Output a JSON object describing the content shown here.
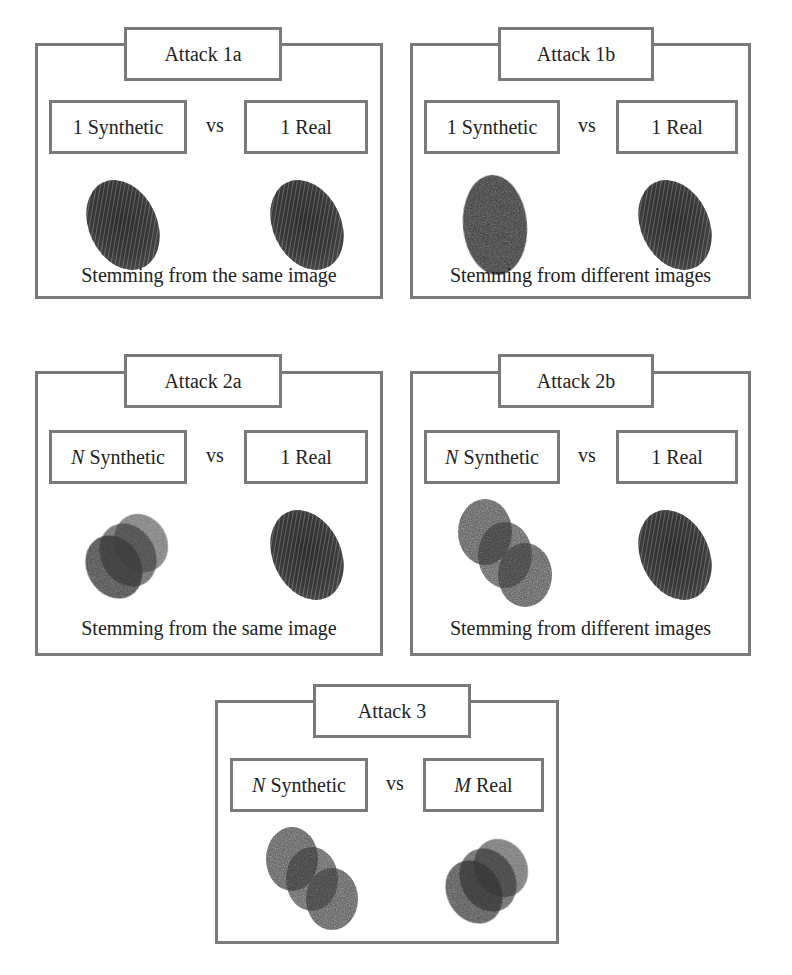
{
  "panels": [
    {
      "id": "attack-1a",
      "title": "Attack 1a",
      "left": {
        "prefix": "1",
        "prefix_italic": false,
        "label": "Synthetic"
      },
      "vs": "vs",
      "right": {
        "prefix": "1",
        "prefix_italic": false,
        "label": "Real"
      },
      "left_image": "single-synthetic-fingerprint",
      "right_image": "single-real-fingerprint",
      "caption": "Stemming from the same image"
    },
    {
      "id": "attack-1b",
      "title": "Attack 1b",
      "left": {
        "prefix": "1",
        "prefix_italic": false,
        "label": "Synthetic"
      },
      "vs": "vs",
      "right": {
        "prefix": "1",
        "prefix_italic": false,
        "label": "Real"
      },
      "left_image": "single-synthetic-fingerprint",
      "right_image": "single-real-fingerprint",
      "caption": "Stemming from different images"
    },
    {
      "id": "attack-2a",
      "title": "Attack 2a",
      "left": {
        "prefix": "N",
        "prefix_italic": true,
        "label": "Synthetic"
      },
      "vs": "vs",
      "right": {
        "prefix": "1",
        "prefix_italic": false,
        "label": "Real"
      },
      "left_image": "multiple-synthetic-fingerprints-overlapped",
      "right_image": "single-real-fingerprint",
      "caption": "Stemming from the same image"
    },
    {
      "id": "attack-2b",
      "title": "Attack 2b",
      "left": {
        "prefix": "N",
        "prefix_italic": true,
        "label": "Synthetic"
      },
      "vs": "vs",
      "right": {
        "prefix": "1",
        "prefix_italic": false,
        "label": "Real"
      },
      "left_image": "multiple-synthetic-fingerprints-spread",
      "right_image": "single-real-fingerprint",
      "caption": "Stemming from different images"
    },
    {
      "id": "attack-3",
      "title": "Attack 3",
      "left": {
        "prefix": "N",
        "prefix_italic": true,
        "label": "Synthetic"
      },
      "vs": "vs",
      "right": {
        "prefix": "M",
        "prefix_italic": true,
        "label": "Real"
      },
      "left_image": "multiple-synthetic-fingerprints-spread",
      "right_image": "multiple-real-fingerprints-overlapped",
      "caption": ""
    }
  ],
  "colors": {
    "border": "#7a7a7a",
    "fingerprint_dark": "#2a2a2a",
    "fingerprint_mid": "#4a4a4a"
  }
}
